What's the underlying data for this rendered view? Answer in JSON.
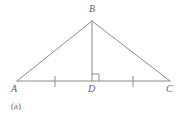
{
  "figure": {
    "type": "geometry-diagram",
    "shape_name": "isosceles-triangle-with-altitude",
    "caption": "(a)",
    "background_color": "#ffffff",
    "stroke_color": "#8a8a8a",
    "label_color": "#5f5f5f",
    "caption_color": "#6b6b6b",
    "stroke_width": 1,
    "vertices": [
      {
        "id": "A",
        "label": "A",
        "x": 17,
        "y": 81,
        "label_x": 11,
        "label_y": 84
      },
      {
        "id": "B",
        "label": "B",
        "x": 92,
        "y": 21,
        "label_x": 89,
        "label_y": 4
      },
      {
        "id": "C",
        "label": "C",
        "x": 170,
        "y": 81,
        "label_x": 166,
        "label_y": 84
      },
      {
        "id": "D",
        "label": "D",
        "x": 92,
        "y": 81,
        "label_x": 88,
        "label_y": 84
      }
    ],
    "segments": [
      {
        "name": "side-AB",
        "from": "A",
        "to": "B",
        "x1": 17,
        "y1": 81,
        "x2": 92,
        "y2": 21
      },
      {
        "name": "side-BC",
        "from": "B",
        "to": "C",
        "x1": 92,
        "y1": 21,
        "x2": 170,
        "y2": 81
      },
      {
        "name": "base-AC",
        "from": "A",
        "to": "C",
        "x1": 17,
        "y1": 81,
        "x2": 170,
        "y2": 81
      },
      {
        "name": "altitude-BD",
        "from": "B",
        "to": "D",
        "x1": 92,
        "y1": 21,
        "x2": 92,
        "y2": 81
      }
    ],
    "right_angle_marker": {
      "name": "right-angle-at-D",
      "at_vertex": "D",
      "x": 92,
      "y": 81,
      "size": 7,
      "orientation": "right-of-altitude"
    },
    "congruence_ticks": [
      {
        "name": "tick-AD",
        "segment": "A-D",
        "x": 55,
        "y1": 76,
        "y2": 87
      },
      {
        "name": "tick-DC",
        "segment": "D-C",
        "x": 133,
        "y1": 76,
        "y2": 87
      }
    ]
  }
}
